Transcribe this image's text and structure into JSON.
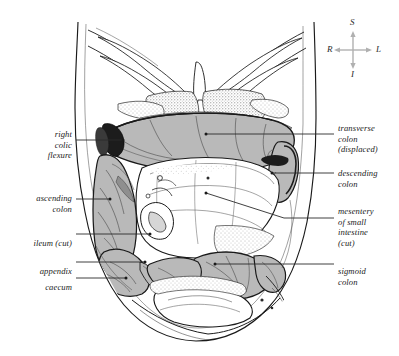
{
  "figure": {
    "background_color": "#ffffff",
    "ink_color": "#1a1a1a",
    "bowel_fill_color": "#b9b9b9",
    "bowel_fill_dark": "#8f8f8f",
    "accent_black": "#161616",
    "stipple_color": "#6e6e6e",
    "leader_color": "#2b2b2b"
  },
  "orientation_compass": {
    "name": "anatomical-orientation-indicator",
    "superior": "S",
    "inferior": "I",
    "right": "R",
    "left": "L",
    "axis_color": "#b0b0b0"
  },
  "labels_left": [
    {
      "id": "right-colic-flexure",
      "text": "right\ncolic\nflexure",
      "lines": [
        "right",
        "colic",
        "flexure"
      ],
      "text_right_x": 72,
      "text_top_y": 119,
      "leader": {
        "x1": 76,
        "y1": 140,
        "x2": 123,
        "y2": 140,
        "dot_x": 123,
        "dot_y": 140
      }
    },
    {
      "id": "ascending-colon",
      "text": "ascending\ncolon",
      "lines": [
        "ascending",
        "colon"
      ],
      "text_right_x": 72,
      "text_top_y": 183,
      "leader": {
        "x1": 76,
        "y1": 199,
        "x2": 110,
        "y2": 199,
        "dot_x": 110,
        "dot_y": 199
      }
    },
    {
      "id": "ileum-cut",
      "text": "ileum (cut)",
      "lines": [
        "ileum (cut)"
      ],
      "text_right_x": 72,
      "text_top_y": 228,
      "leader": {
        "x1": 76,
        "y1": 234,
        "x2": 150,
        "y2": 234,
        "dot_x": 150,
        "dot_y": 234
      }
    },
    {
      "id": "appendix",
      "text": "appendix",
      "lines": [
        "appendix"
      ],
      "text_right_x": 72,
      "text_top_y": 256,
      "leader": {
        "x1": 76,
        "y1": 262,
        "x2": 145,
        "y2": 262,
        "dot_x": 145,
        "dot_y": 262
      }
    },
    {
      "id": "caecum",
      "text": "caecum",
      "lines": [
        "caecum"
      ],
      "text_right_x": 72,
      "text_top_y": 272,
      "leader": {
        "x1": 76,
        "y1": 278,
        "x2": 126,
        "y2": 278,
        "dot_x": 126,
        "dot_y": 278
      }
    }
  ],
  "labels_right": [
    {
      "id": "transverse-colon-displaced",
      "text": "transverse\ncolon\n(displaced)",
      "lines": [
        "transverse",
        "colon",
        "(displaced)"
      ],
      "text_left_x": 338,
      "text_top_y": 113,
      "leader": {
        "x1": 334,
        "y1": 134,
        "x2": 206,
        "y2": 134,
        "dot_x": 206,
        "dot_y": 134
      }
    },
    {
      "id": "descending-colon",
      "text": "descending\ncolon",
      "lines": [
        "descending",
        "colon"
      ],
      "text_left_x": 338,
      "text_top_y": 158,
      "leader": {
        "x1": 334,
        "y1": 173,
        "x2": 272,
        "y2": 173,
        "dot_x": 272,
        "dot_y": 173
      }
    },
    {
      "id": "mesentery-of-small-intestine-cut",
      "text": "mesentery\nof small\nintestine\n(cut)",
      "lines": [
        "mesentery",
        "of small",
        "intestine",
        "(cut)"
      ],
      "text_left_x": 338,
      "text_top_y": 196,
      "leader": {
        "x1": 334,
        "y1": 218,
        "x2": 206,
        "y2": 193,
        "dot_x": 206,
        "dot_y": 193
      }
    },
    {
      "id": "sigmoid-colon",
      "text": "sigmoid\ncolon",
      "lines": [
        "sigmoid",
        "colon"
      ],
      "text_left_x": 338,
      "text_top_y": 256,
      "leader": {
        "x1": 334,
        "y1": 264,
        "x2": 215,
        "y2": 264,
        "dot_x": 215,
        "dot_y": 264
      }
    }
  ]
}
